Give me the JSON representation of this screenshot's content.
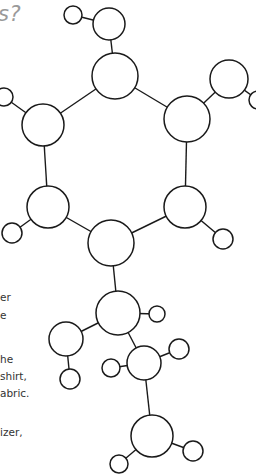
{
  "heading": {
    "text": "s?"
  },
  "body_text": [
    {
      "text": "er",
      "x": 0,
      "y": 291
    },
    {
      "text": "e",
      "x": 0,
      "y": 309
    },
    {
      "text": "he",
      "x": 0,
      "y": 353
    },
    {
      "text": " shirt,",
      "x": 0,
      "y": 370
    },
    {
      "text": "abric.",
      "x": 0,
      "y": 387
    },
    {
      "text": "izer,",
      "x": 0,
      "y": 426
    }
  ],
  "diagram": {
    "stroke_color": "#1a1a1a",
    "fill_color": "#ffffff",
    "atoms": [
      {
        "id": "a1",
        "x": 73,
        "y": 15,
        "r": 9
      },
      {
        "id": "a2",
        "x": 109,
        "y": 24,
        "r": 16
      },
      {
        "id": "ring1",
        "x": 115,
        "y": 76,
        "r": 23
      },
      {
        "id": "ring2",
        "x": 187,
        "y": 119,
        "r": 23
      },
      {
        "id": "a3",
        "x": 229,
        "y": 79,
        "r": 19
      },
      {
        "id": "a4",
        "x": 258,
        "y": 100,
        "r": 9
      },
      {
        "id": "ring6",
        "x": 43,
        "y": 125,
        "r": 21
      },
      {
        "id": "a5",
        "x": 4,
        "y": 97,
        "r": 9
      },
      {
        "id": "ring5",
        "x": 48,
        "y": 207,
        "r": 21
      },
      {
        "id": "a6",
        "x": 12,
        "y": 233,
        "r": 10
      },
      {
        "id": "ring3",
        "x": 185,
        "y": 207,
        "r": 21
      },
      {
        "id": "a7",
        "x": 223,
        "y": 239,
        "r": 10
      },
      {
        "id": "ring4",
        "x": 111,
        "y": 243,
        "r": 23
      },
      {
        "id": "c1",
        "x": 118,
        "y": 313,
        "r": 22
      },
      {
        "id": "h1",
        "x": 157,
        "y": 314,
        "r": 8
      },
      {
        "id": "c2",
        "x": 66,
        "y": 339,
        "r": 17
      },
      {
        "id": "h2",
        "x": 70,
        "y": 379,
        "r": 10
      },
      {
        "id": "c3",
        "x": 144,
        "y": 363,
        "r": 17
      },
      {
        "id": "h3",
        "x": 111,
        "y": 368,
        "r": 9
      },
      {
        "id": "h4",
        "x": 179,
        "y": 349,
        "r": 10
      },
      {
        "id": "c4",
        "x": 152,
        "y": 436,
        "r": 21
      },
      {
        "id": "h5",
        "x": 193,
        "y": 451,
        "r": 10
      },
      {
        "id": "h6",
        "x": 119,
        "y": 464,
        "r": 9
      }
    ],
    "bonds": [
      [
        "a1",
        "a2"
      ],
      [
        "a2",
        "ring1"
      ],
      [
        "ring1",
        "ring2"
      ],
      [
        "ring2",
        "a3"
      ],
      [
        "a3",
        "a4"
      ],
      [
        "ring1",
        "ring6"
      ],
      [
        "ring6",
        "a5"
      ],
      [
        "ring6",
        "ring5"
      ],
      [
        "ring5",
        "a6"
      ],
      [
        "ring5",
        "ring4"
      ],
      [
        "ring2",
        "ring3"
      ],
      [
        "ring3",
        "a7"
      ],
      [
        "ring3",
        "ring4"
      ],
      [
        "ring4",
        "c1"
      ],
      [
        "c1",
        "h1"
      ],
      [
        "c1",
        "c2"
      ],
      [
        "c2",
        "h2"
      ],
      [
        "c1",
        "c3"
      ],
      [
        "c3",
        "h3"
      ],
      [
        "c3",
        "h4"
      ],
      [
        "c3",
        "c4"
      ],
      [
        "c4",
        "h5"
      ],
      [
        "c4",
        "h6"
      ]
    ]
  }
}
